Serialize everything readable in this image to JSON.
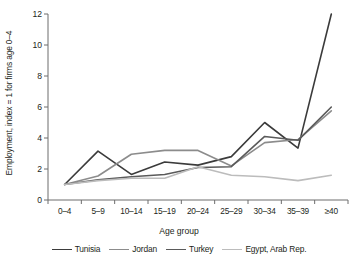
{
  "chart_data": {
    "type": "line",
    "title": "",
    "xlabel": "Age group",
    "ylabel": "Employment, index = 1 for firms age 0–4",
    "categories": [
      "0–4",
      "5–9",
      "10–14",
      "15–19",
      "20–24",
      "25–29",
      "30–34",
      "35–39",
      "≥40"
    ],
    "ylim": [
      0,
      12
    ],
    "yticks": [
      0,
      2,
      4,
      6,
      8,
      10,
      12
    ],
    "ytick_labels": [
      "0",
      "2",
      "4",
      "6",
      "8",
      "10",
      "12"
    ],
    "grid": false,
    "legend_position": "bottom",
    "series": [
      {
        "name": "Tunisia",
        "color": "#3b3b3b",
        "values": [
          1.0,
          3.15,
          1.65,
          2.45,
          2.25,
          2.8,
          5.0,
          3.35,
          12.0
        ]
      },
      {
        "name": "Jordan",
        "color": "#8c8c8c",
        "values": [
          1.0,
          1.55,
          2.95,
          3.2,
          3.2,
          2.2,
          3.7,
          3.9,
          5.75
        ]
      },
      {
        "name": "Turkey",
        "color": "#5a5a5a",
        "values": [
          1.0,
          1.3,
          1.5,
          1.65,
          2.1,
          2.15,
          4.1,
          3.85,
          6.0
        ]
      },
      {
        "name": "Egypt, Arab Rep.",
        "color": "#bcbcbc",
        "values": [
          1.0,
          1.25,
          1.4,
          1.4,
          2.15,
          1.6,
          1.5,
          1.25,
          1.6
        ]
      }
    ]
  },
  "axes": {
    "xaxis_title": "Age group",
    "yaxis_title": "Employment, index = 1 for firms age 0–4"
  }
}
